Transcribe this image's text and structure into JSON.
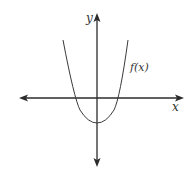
{
  "figure": {
    "axis_labels": {
      "x": "x",
      "y": "y"
    },
    "curve_label": "f(x)",
    "colors": {
      "axis": "#2b2b2b",
      "curve": "#3a3a3a",
      "text": "#333333",
      "background": "#ffffff"
    },
    "geometry": {
      "origin_px": [
        97,
        98
      ],
      "x_axis_px": [
        19,
        184
      ],
      "y_axis_px": [
        13,
        167
      ],
      "curve": {
        "type": "parabola",
        "opens": "up",
        "vertex_px": [
          97,
          123
        ],
        "x_intercepts_px": [
          74,
          118
        ],
        "endpoints_px": [
          [
            63,
            40
          ],
          [
            128,
            40
          ]
        ]
      }
    }
  }
}
